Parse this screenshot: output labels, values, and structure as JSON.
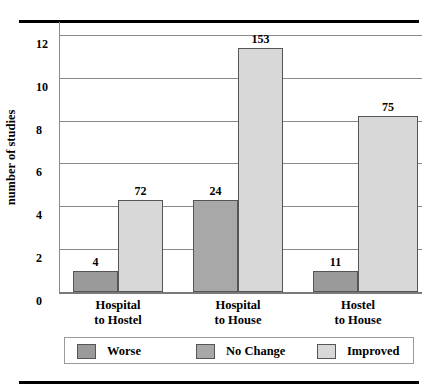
{
  "chart_data": {
    "type": "bar",
    "title": "",
    "subtitle": "",
    "xlabel": "",
    "ylabel": "number of studies",
    "ylim": [
      0,
      12.6
    ],
    "yticks": [
      0,
      2,
      4,
      6,
      8,
      10,
      12
    ],
    "ytick_labels": [
      "0",
      "2",
      "4",
      "6",
      "8",
      "10",
      "12"
    ],
    "grid": true,
    "legend_position": "bottom",
    "categories": [
      "Hospital to Hostel",
      "Hospital to House",
      "Hostel to House"
    ],
    "category_lines": [
      [
        "Hospital",
        "to Hostel"
      ],
      [
        "Hospital",
        "to House"
      ],
      [
        "Hostel",
        "to House"
      ]
    ],
    "series": [
      {
        "name": "Worse",
        "color": "#9a9a9a",
        "values": [
          1.0,
          null,
          1.0
        ],
        "data_labels": [
          "4",
          null,
          "11"
        ]
      },
      {
        "name": "No Change",
        "color": "#a8a8a8",
        "values": [
          null,
          4.3,
          null
        ],
        "data_labels": [
          null,
          "24",
          null
        ]
      },
      {
        "name": "Improved",
        "color": "#d8d8d8",
        "values": [
          4.3,
          11.4,
          8.2
        ],
        "data_labels": [
          "72",
          "153",
          "75"
        ]
      }
    ],
    "bars": [
      {
        "group": 0,
        "series": "Worse",
        "value": 1.0,
        "label": "4",
        "x": 14,
        "w": 45
      },
      {
        "group": 0,
        "series": "Improved",
        "value": 4.3,
        "label": "72",
        "x": 59,
        "w": 45
      },
      {
        "group": 1,
        "series": "No Change",
        "value": 4.3,
        "label": "24",
        "x": 134,
        "w": 45
      },
      {
        "group": 1,
        "series": "Improved",
        "value": 11.4,
        "label": "153",
        "x": 179,
        "w": 45
      },
      {
        "group": 2,
        "series": "Worse",
        "value": 1.0,
        "label": "11",
        "x": 254,
        "w": 45
      },
      {
        "group": 2,
        "series": "Improved",
        "value": 8.2,
        "label": "75",
        "x": 299,
        "w": 60
      }
    ]
  },
  "legend": {
    "items": [
      {
        "label": "Worse",
        "color": "#9a9a9a",
        "x": 12
      },
      {
        "label": "No Change",
        "color": "#a8a8a8",
        "x": 131
      },
      {
        "label": "Improved",
        "color": "#d8d8d8",
        "x": 252
      }
    ]
  },
  "colors": {
    "worse": "#9a9a9a",
    "no_change": "#a8a8a8",
    "improved": "#d8d8d8",
    "gridline": "#8a8a8a",
    "rule": "#000000"
  }
}
